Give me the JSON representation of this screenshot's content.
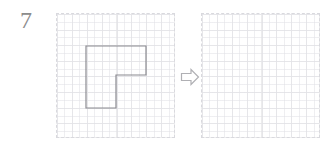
{
  "exercise": {
    "number": "7"
  },
  "colors": {
    "shape_stroke": "#8a8a90",
    "grid_line": "#ececed",
    "grid_border": "#d9d9de",
    "arrow_stroke": "#b0b0b4",
    "label_text": "#8c8c8c",
    "background": "#ffffff"
  },
  "left_panel": {
    "name": "source-grid",
    "columns": 8,
    "rows": 8,
    "shape": {
      "name": "l-shaped-polygon",
      "vertices": "86,46 146,46 146,75 116,75 116,108 86,108",
      "description": "rotated L shape"
    }
  },
  "arrow": {
    "name": "transformation-arrow",
    "direction": "right",
    "glyph": "arrow-right-outline"
  },
  "right_panel": {
    "name": "answer-grid",
    "columns": 8,
    "rows": 8,
    "shape": null
  }
}
